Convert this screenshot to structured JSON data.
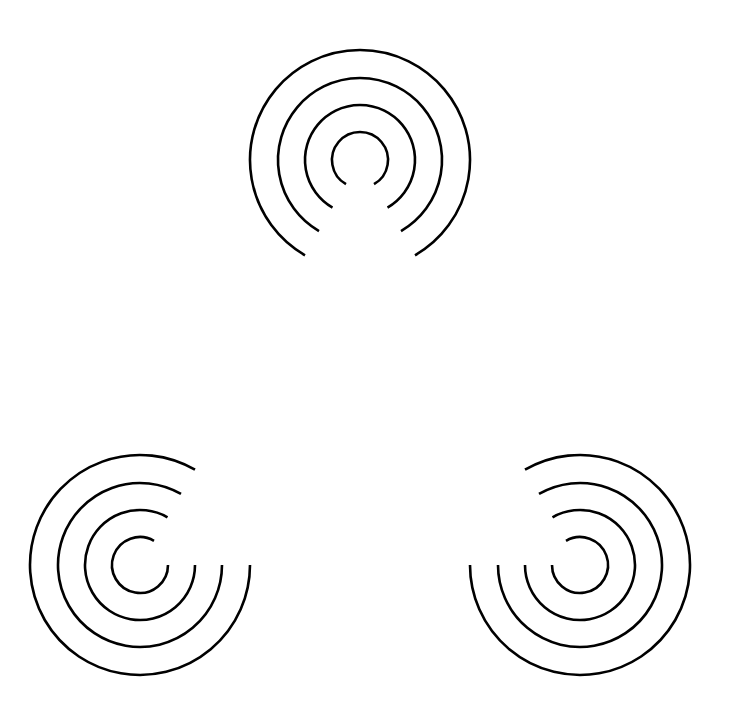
{
  "figure": {
    "background": "#ffffff",
    "stroke_color": "#000000",
    "stroke_width": 2.6,
    "radii": [
      28,
      55,
      82,
      110
    ],
    "gap_degrees": 60,
    "inducers": [
      {
        "name": "top",
        "cx": 360,
        "cy": 160,
        "gap_center_deg": 90
      },
      {
        "name": "bottom-left",
        "cx": 140,
        "cy": 565,
        "gap_center_deg": -30
      },
      {
        "name": "bottom-right",
        "cx": 580,
        "cy": 565,
        "gap_center_deg": 210
      }
    ]
  }
}
